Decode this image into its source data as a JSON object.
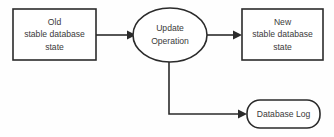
{
  "diagram": {
    "background_color": "#fefefe",
    "stroke_color": "#2b2b2b",
    "text_color": "#3a3a3a",
    "nodes": [
      {
        "id": "old-state",
        "shape": "rectangle",
        "lines": [
          "Old",
          "stable database",
          "state"
        ]
      },
      {
        "id": "update-operation",
        "shape": "ellipse",
        "lines": [
          "Update",
          "Operation"
        ]
      },
      {
        "id": "new-state",
        "shape": "rectangle",
        "lines": [
          "New",
          "stable database",
          "state"
        ]
      },
      {
        "id": "database-log",
        "shape": "rounded-rectangle",
        "lines": [
          "Database Log"
        ]
      }
    ],
    "edges": [
      {
        "id": "old-to-update",
        "from": "old-state",
        "to": "update-operation",
        "style": "straight-arrow"
      },
      {
        "id": "update-to-new",
        "from": "update-operation",
        "to": "new-state",
        "style": "straight-arrow"
      },
      {
        "id": "update-to-log",
        "from": "update-operation",
        "to": "database-log",
        "style": "elbow-arrow"
      }
    ]
  }
}
